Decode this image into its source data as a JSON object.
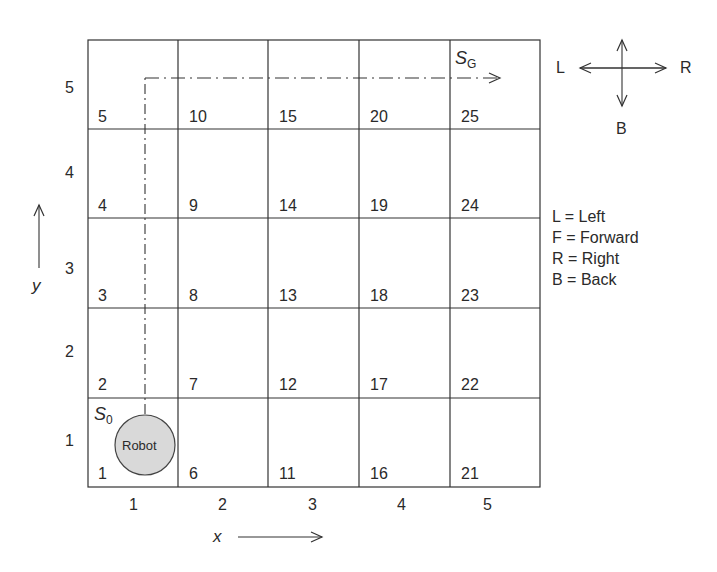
{
  "grid": {
    "cols": 5,
    "rows": 5,
    "cells": [
      {
        "id": "1",
        "col": 1,
        "row": 1
      },
      {
        "id": "2",
        "col": 1,
        "row": 2
      },
      {
        "id": "3",
        "col": 1,
        "row": 3
      },
      {
        "id": "4",
        "col": 1,
        "row": 4
      },
      {
        "id": "5",
        "col": 1,
        "row": 5
      },
      {
        "id": "6",
        "col": 2,
        "row": 1
      },
      {
        "id": "7",
        "col": 2,
        "row": 2
      },
      {
        "id": "8",
        "col": 2,
        "row": 3
      },
      {
        "id": "9",
        "col": 2,
        "row": 4
      },
      {
        "id": "10",
        "col": 2,
        "row": 5
      },
      {
        "id": "11",
        "col": 3,
        "row": 1
      },
      {
        "id": "12",
        "col": 3,
        "row": 2
      },
      {
        "id": "13",
        "col": 3,
        "row": 3
      },
      {
        "id": "14",
        "col": 3,
        "row": 4
      },
      {
        "id": "15",
        "col": 3,
        "row": 5
      },
      {
        "id": "16",
        "col": 4,
        "row": 1
      },
      {
        "id": "17",
        "col": 4,
        "row": 2
      },
      {
        "id": "18",
        "col": 4,
        "row": 3
      },
      {
        "id": "19",
        "col": 4,
        "row": 4
      },
      {
        "id": "20",
        "col": 4,
        "row": 5
      },
      {
        "id": "21",
        "col": 5,
        "row": 1
      },
      {
        "id": "22",
        "col": 5,
        "row": 2
      },
      {
        "id": "23",
        "col": 5,
        "row": 3
      },
      {
        "id": "24",
        "col": 5,
        "row": 4
      },
      {
        "id": "25",
        "col": 5,
        "row": 5
      }
    ]
  },
  "axes": {
    "x_label": "x",
    "y_label": "y",
    "x_ticks": [
      "1",
      "2",
      "3",
      "4",
      "5"
    ],
    "y_ticks": [
      "1",
      "2",
      "3",
      "4",
      "5"
    ]
  },
  "states": {
    "start": {
      "symbol": "S",
      "subscript": "0"
    },
    "goal": {
      "symbol": "S",
      "subscript": "G"
    }
  },
  "robot": {
    "label": "Robot",
    "fill": "#d9d9d9"
  },
  "compass": {
    "left": "L",
    "right": "R",
    "back": "B"
  },
  "legend": [
    "L = Left",
    "F = Forward",
    "R = Right",
    "B = Back"
  ]
}
